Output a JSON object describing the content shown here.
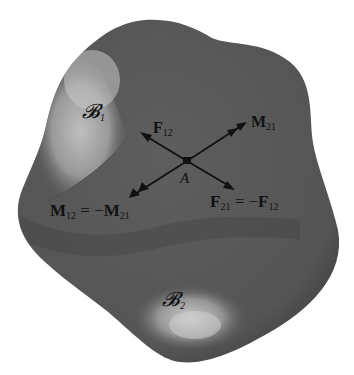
{
  "figure": {
    "type": "free-body-interaction-diagram",
    "background": "#ffffff",
    "body_color": "#585858",
    "highlight_color": "#bdbdbd",
    "regions": [
      {
        "id": "B1",
        "label": "𝓑",
        "subscript": "1"
      },
      {
        "id": "B2",
        "label": "𝓑",
        "subscript": "2"
      }
    ],
    "point": {
      "label": "A"
    },
    "vectors": [
      {
        "id": "F12",
        "symbol": "F",
        "subscript": "12",
        "direction": "upper-left",
        "arrowhead": "single"
      },
      {
        "id": "M21",
        "symbol": "M",
        "subscript": "21",
        "direction": "upper-right",
        "arrowhead": "double"
      },
      {
        "id": "M12",
        "symbol": "M",
        "subscript": "12",
        "direction": "lower-left",
        "arrowhead": "double"
      },
      {
        "id": "F21",
        "symbol": "F",
        "subscript": "21",
        "direction": "lower-right",
        "arrowhead": "single"
      }
    ],
    "equations": {
      "moment": {
        "lhs": "M",
        "lhs_sub": "12",
        "eq": " = −",
        "rhs": "M",
        "rhs_sub": "21"
      },
      "force": {
        "lhs": "F",
        "lhs_sub": "21",
        "eq": " = −",
        "rhs": "F",
        "rhs_sub": "12"
      }
    }
  }
}
